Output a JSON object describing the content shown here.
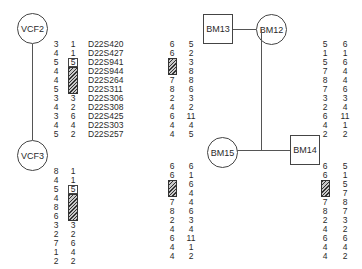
{
  "individuals": {
    "vcf2": {
      "label": "VCF2",
      "shape": "circle"
    },
    "vcf3": {
      "label": "VCF3",
      "shape": "circle"
    },
    "bm13": {
      "label": "BM13",
      "shape": "square"
    },
    "bm12": {
      "label": "BM12",
      "shape": "circle"
    },
    "bm15": {
      "label": "BM15",
      "shape": "circle"
    },
    "bm14": {
      "label": "BM14",
      "shape": "square"
    }
  },
  "markers": [
    "D22S420",
    "D22S427",
    "D22S941",
    "D22S944",
    "D22S264",
    "D22S311",
    "D22S306",
    "D22S308",
    "D22S425",
    "D22S303",
    "D22S257"
  ],
  "haplotypes": {
    "vcf2": {
      "a": [
        "3",
        "4",
        "5",
        "4",
        "4",
        "5",
        "3",
        "4",
        "3",
        "4",
        "5"
      ],
      "b": [
        "1",
        "1",
        "5",
        "",
        "",
        "",
        "3",
        "2",
        "6",
        "4",
        "2"
      ]
    },
    "vcf3": {
      "a": [
        "8",
        "4",
        "5",
        "4",
        "8",
        "6",
        "3",
        "2",
        "7",
        "1",
        "2"
      ],
      "b": [
        "1",
        "1",
        "5",
        "",
        "",
        "",
        "3",
        "2",
        "6",
        "4",
        "2"
      ]
    },
    "mid_upper": {
      "a": [
        "6",
        "6",
        "",
        "",
        "7",
        "8",
        "2",
        "4",
        "6",
        "4",
        "4"
      ],
      "b": [
        "5",
        "2",
        "3",
        "8",
        "8",
        "6",
        "3",
        "2",
        "11",
        "4",
        "5"
      ]
    },
    "bm15": {
      "a": [
        "6",
        "6",
        "",
        "",
        "7",
        "8",
        "2",
        "4",
        "6",
        "4",
        "4"
      ],
      "b": [
        "6",
        "1",
        "6",
        "4",
        "4",
        "6",
        "3",
        "4",
        "11",
        "1",
        "2"
      ]
    },
    "bm12": {
      "a": [
        "5",
        "1",
        "5",
        "7",
        "8",
        "7",
        "3",
        "2",
        "6",
        "4",
        "2"
      ],
      "b": [
        "6",
        "1",
        "6",
        "4",
        "4",
        "6",
        "3",
        "4",
        "11",
        "1",
        "2"
      ]
    },
    "bm14": {
      "a": [
        "6",
        "6",
        "",
        "",
        "7",
        "8",
        "2",
        "4",
        "6",
        "4",
        "4"
      ],
      "b": [
        "5",
        "1",
        "5",
        "7",
        "8",
        "7",
        "3",
        "2",
        "6",
        "4",
        "2"
      ]
    }
  },
  "legend": {
    "boxed_allele": "boxed value marks start of deleted region",
    "hatched": "hatched bar indicates deleted/uninformative region"
  }
}
